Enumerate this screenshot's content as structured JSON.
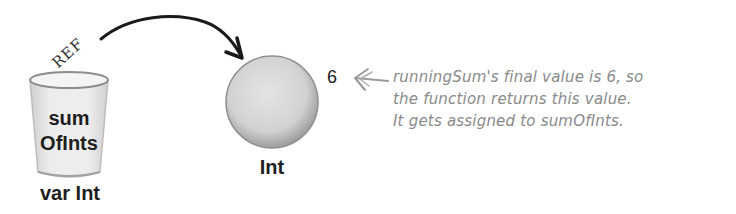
{
  "variable": {
    "ref_label": "REF",
    "name_line1": "sum",
    "name_line2": "OfInts",
    "type": "var Int"
  },
  "object": {
    "type": "Int",
    "value": "6"
  },
  "annotation": {
    "lines": [
      "runningSum's final value is 6, so",
      "the function returns this value.",
      "It gets assigned to sumOfInts."
    ]
  },
  "colors": {
    "ink": "#1e1e1e",
    "annotation": "#8a8a8a",
    "object_fill": "#d9d9d9",
    "cup_fill": "#eeeeee"
  }
}
